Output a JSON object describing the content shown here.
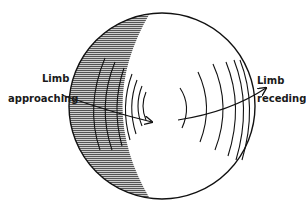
{
  "diagram": {
    "labels": {
      "left_line1": "Limb",
      "left_line2": "approaching",
      "right_line1": "Limb",
      "right_line2": "receding"
    },
    "colors": {
      "stroke": "#111111",
      "shade": "#888888",
      "background": "#ffffff"
    }
  }
}
